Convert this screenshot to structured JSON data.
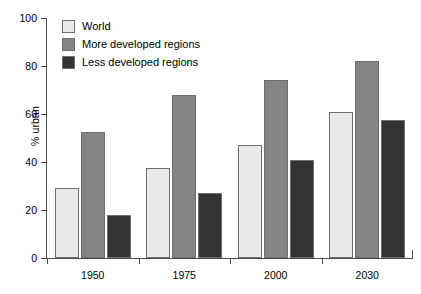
{
  "chart_data": {
    "type": "bar",
    "title": "",
    "subtitle": "",
    "xlabel": "",
    "ylabel": "% urban",
    "ylim": [
      0,
      100
    ],
    "yticks": [
      0,
      20,
      40,
      60,
      80,
      100
    ],
    "ytick_labels": [
      "0",
      "20",
      "40",
      "60",
      "80",
      "100"
    ],
    "categories": [
      "1950",
      "1975",
      "2000",
      "2030"
    ],
    "grid": false,
    "legend_position": "top-left",
    "series": [
      {
        "name": "World",
        "color": "#e8e8e8",
        "values": [
          29,
          37.5,
          47,
          61
        ]
      },
      {
        "name": "More developed regions",
        "color": "#848484",
        "values": [
          52.5,
          68,
          74,
          82
        ]
      },
      {
        "name": "Less developed regions",
        "color": "#333333",
        "values": [
          18,
          27,
          41,
          57.5
        ]
      }
    ],
    "annotations": []
  },
  "axes": {
    "y_title": "% urban",
    "y_labels": [
      "100",
      "80",
      "60",
      "40",
      "20",
      "0"
    ],
    "x_labels": [
      "1950",
      "1975",
      "2000",
      "2030"
    ]
  },
  "legend": {
    "items": [
      {
        "label": "World",
        "color": "#e8e8e8"
      },
      {
        "label": "More developed regions",
        "color": "#848484"
      },
      {
        "label": "Less developed regions",
        "color": "#333333"
      }
    ]
  },
  "colors": {
    "axis": "#4d4d4d",
    "bar_outline": "#6e6e6e",
    "background": "#ffffff",
    "text": "#000000"
  }
}
